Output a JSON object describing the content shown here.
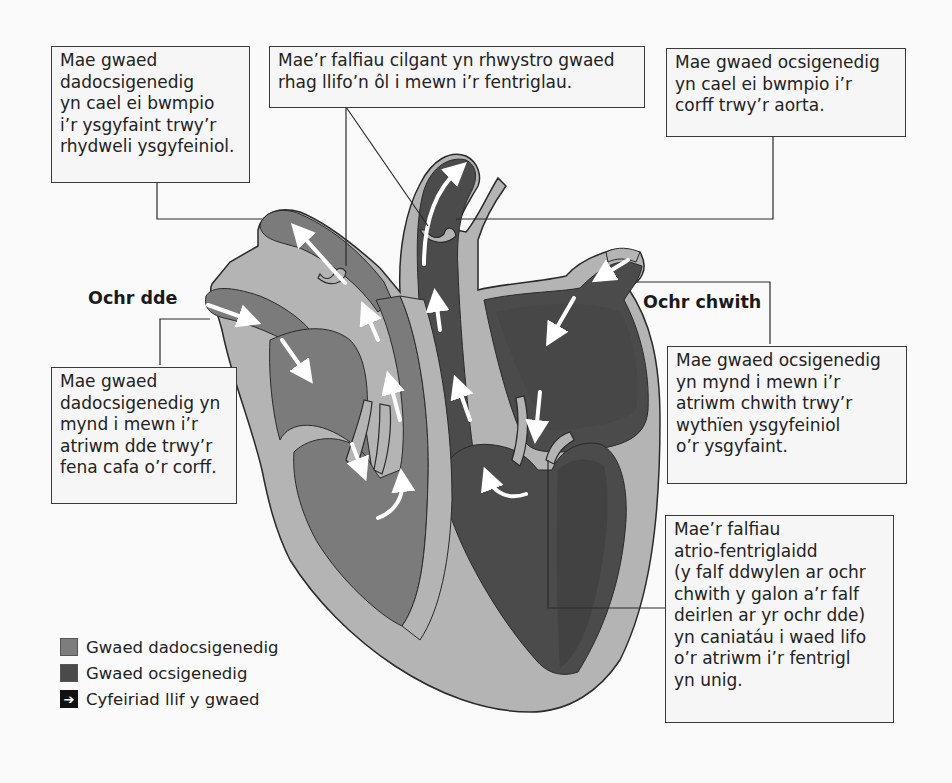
{
  "diagram": {
    "type": "labelled-anatomy",
    "language": "cy",
    "side_labels": {
      "right_side": "Ochr dde",
      "left_side": "Ochr chwith"
    },
    "annotations": {
      "pulmonary_artery": {
        "lines": [
          "Mae gwaed",
          "dadocsigenedig",
          "yn cael ei bwmpio",
          "i’r ysgyfaint trwy’r",
          "rhydweli ysgyfeiniol."
        ]
      },
      "semilunar_valves": {
        "lines": [
          "Mae’r falfiau cilgant yn rhwystro gwaed",
          "rhag llifo’n ôl i mewn i’r fentriglau."
        ]
      },
      "aorta": {
        "lines": [
          "Mae gwaed ocsigenedig",
          "yn cael ei bwmpio i’r",
          "corff trwy’r aorta."
        ]
      },
      "vena_cava": {
        "lines": [
          "Mae gwaed",
          "dadocsigenedig yn",
          "mynd i mewn i’r",
          "atriwm dde trwy’r",
          "fena cafa o’r corff."
        ]
      },
      "pulmonary_vein": {
        "lines": [
          "Mae gwaed ocsigenedig",
          "yn mynd i mewn i’r",
          "atriwm chwith trwy’r",
          "wythïen ysgyfeiniol",
          "o’r ysgyfaint."
        ]
      },
      "av_valves": {
        "lines": [
          "Mae’r falfiau",
          "atrio-fentriglaidd",
          "(y falf ddwylen ar ochr",
          "chwith y galon a’r falf",
          "deirlen ar yr ochr dde)",
          "yn caniatáu i waed lifo",
          "o’r atriwm i’r fentrigl",
          "yn unig."
        ]
      }
    },
    "legend": [
      {
        "label": "Gwaed dadocsigenedig",
        "icon": "swatch-medium-grey",
        "color": "#7d7d7d"
      },
      {
        "label": "Gwaed ocsigenedig",
        "icon": "swatch-dark-grey",
        "color": "#4a4a4a"
      },
      {
        "label": "Cyfeiriad llif y gwaed",
        "icon": "arrow-right-icon",
        "glyph": "➔"
      }
    ],
    "colors": {
      "deoxygenated": "#7b7b7b",
      "oxygenated": "#4b4b4b",
      "oxygenated_deep": "#3f3f3f",
      "wall": "#b4b4b4",
      "outline": "#2a2a2a",
      "flow_arrow": "#ffffff"
    }
  }
}
